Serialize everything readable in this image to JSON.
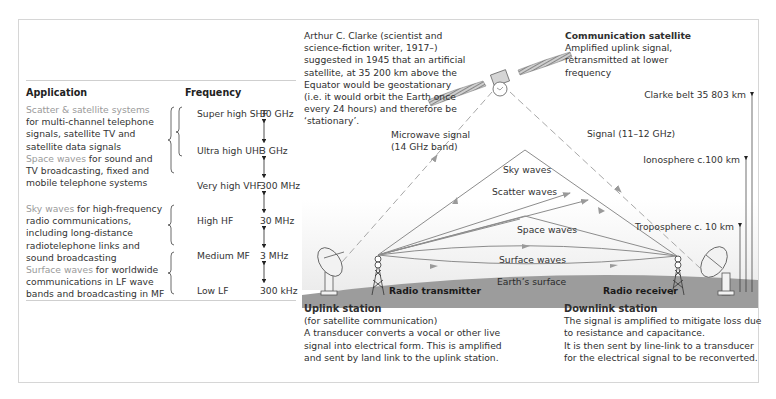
{
  "table": {
    "header_application": "Application",
    "header_frequency": "Frequency",
    "applications": [
      {
        "highlight": "Scatter & satellite systems",
        "lines": [
          "for multi-channel telephone",
          "signals, satellite TV and",
          "satellite data signals"
        ]
      },
      {
        "highlight": "Space waves",
        "first_rest": " for sound and",
        "lines": [
          "TV broadcasting, fixed and",
          "mobile telephone systems"
        ]
      },
      {
        "highlight": "Sky waves",
        "first_rest": " for high-frequency",
        "lines": [
          "radio communications,",
          "including long-distance",
          "radiotelephone links and",
          "sound broadcasting"
        ]
      },
      {
        "highlight": "Surface waves",
        "first_rest": " for worldwide",
        "lines": [
          "communications in LF wave",
          "bands and broadcasting in MF"
        ]
      }
    ],
    "bands": [
      {
        "name": "Super high SHF",
        "value": "30 GHz"
      },
      {
        "name": "Ultra high UHF",
        "value": "3 GHz"
      },
      {
        "name": "Very high VHF",
        "value": "300 MHz"
      },
      {
        "name": "High HF",
        "value": "30 MHz"
      },
      {
        "name": "Medium MF",
        "value": "3 MHz"
      },
      {
        "name": "Low LF",
        "value": "300 kHz"
      }
    ]
  },
  "clarke_note": [
    "Arthur C. Clarke (scientist and",
    "science-fiction writer, 1917–)",
    "suggested in 1945 that an artificial",
    "satellite, at 35 200 km above the",
    "Equator would be geostationary",
    "(i.e. it would orbit the Earth once",
    "every 24 hours) and therefore be",
    "‘stationary’."
  ],
  "satellite": {
    "title": "Communication satellite",
    "lines": [
      "Amplified uplink signal,",
      "retransmitted at lower",
      "frequency"
    ]
  },
  "altitudes": {
    "clarke_belt": "Clarke belt 35 803 km",
    "ionosphere": "Ionosphere c.100 km",
    "troposphere": "Troposphere c. 10 km"
  },
  "signals": {
    "microwave_1": "Microwave signal",
    "microwave_2": "(14 GHz band)",
    "downlink": "Signal (11–12 GHz)"
  },
  "waves": {
    "sky": "Sky waves",
    "scatter": "Scatter waves",
    "space": "Space waves",
    "surface": "Surface waves",
    "earth": "Earth’s surface"
  },
  "stations": {
    "transmitter": "Radio transmitter",
    "receiver": "Radio receiver"
  },
  "uplink": {
    "title": "Uplink station",
    "lines": [
      "(for satellite communication)",
      "A transducer converts a vocal or other live",
      "signal into electrical form. This is amplified",
      "and sent by land link to the uplink station."
    ]
  },
  "downlink": {
    "title": "Downlink station",
    "lines": [
      "The signal is amplified to mitigate loss due",
      "to resistance and capacitance.",
      "It is then sent by line-link to a transducer",
      "for the electrical signal to be reconverted."
    ]
  },
  "colors": {
    "highlight_text": "#9a9a9a",
    "ground": "#9c9c9c",
    "wave_line": "#8c8c8c",
    "frame_border": "#d6d6d6"
  }
}
